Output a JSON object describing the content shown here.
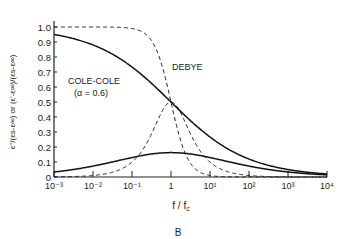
{
  "chart_data": {
    "type": "line",
    "title": "",
    "xlabel": "f / f_c",
    "ylabel": "ε''/(ε_s-ε_∞) or (ε'-ε_∞)/(ε_s-ε_∞)",
    "xscale": "log",
    "xlim": [
      0.001,
      10000
    ],
    "ylim": [
      0,
      1.0
    ],
    "x_ticks": [
      "10⁻³",
      "10⁻²",
      "10⁻¹",
      "1",
      "10¹",
      "10²",
      "10³",
      "10⁴"
    ],
    "y_ticks": [
      "0",
      "0.1",
      "0.2",
      "0.3",
      "0.4",
      "0.5",
      "0.6",
      "0.7",
      "0.8",
      "0.9",
      "1.0"
    ],
    "grid": false,
    "caption": "B",
    "annotations": [
      {
        "text": "COLE-COLE",
        "sub": "(α = 0.6)"
      },
      {
        "text": "DEBYE"
      }
    ],
    "series": [
      {
        "name": "Debye ε' (normalized)",
        "style": "dashed",
        "x": [
          0.001,
          0.01,
          0.1,
          0.3,
          1,
          3,
          10,
          100
        ],
        "values": [
          1.0,
          1.0,
          0.99,
          0.92,
          0.5,
          0.1,
          0.01,
          0.0
        ]
      },
      {
        "name": "Debye ε'' (normalized)",
        "style": "dashed",
        "x": [
          0.001,
          0.01,
          0.1,
          0.3,
          1,
          3,
          10,
          100
        ],
        "values": [
          0.0,
          0.01,
          0.1,
          0.28,
          0.5,
          0.3,
          0.1,
          0.01
        ]
      },
      {
        "name": "Cole-Cole ε' (normalized)",
        "style": "solid",
        "x": [
          0.001,
          0.01,
          0.1,
          1,
          10,
          100,
          1000,
          10000
        ],
        "values": [
          0.94,
          0.88,
          0.76,
          0.5,
          0.24,
          0.12,
          0.06,
          0.03
        ]
      },
      {
        "name": "Cole-Cole ε'' (normalized)",
        "style": "solid",
        "x": [
          0.001,
          0.01,
          0.1,
          1,
          10,
          100,
          1000,
          10000
        ],
        "values": [
          0.03,
          0.07,
          0.13,
          0.17,
          0.13,
          0.07,
          0.04,
          0.02
        ]
      }
    ]
  },
  "labels": {
    "ylabel_main": "ε''/(εs-ε∞) or (ε'-ε∞)/(εs-ε∞)",
    "xlabel": "f / f",
    "xlabel_sub": "c",
    "cole": "COLE-COLE",
    "cole_alpha": "(α = 0.6)",
    "debye": "DEBYE",
    "caption": "B"
  },
  "params": {
    "alpha": 0.6,
    "plot": {
      "x0": 54,
      "x1": 327,
      "y0": 177,
      "y1": 27
    }
  }
}
